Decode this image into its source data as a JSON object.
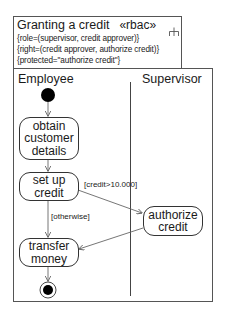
{
  "diagram": {
    "title": "Granting a credit",
    "stereotype": "«rbac»",
    "stereotype_icon": "activity-partition-icon",
    "constraints": [
      "{role=(supervisor, credit approver)}",
      "{right=(credit approver, authorize credit)}",
      "{protected=\"authorize credit\"}"
    ],
    "lanes": [
      {
        "label": "Employee"
      },
      {
        "label": "Supervisor"
      }
    ],
    "actions": [
      {
        "id": "obtain",
        "lines": [
          "obtain",
          "customer",
          "details"
        ],
        "lane": "Employee"
      },
      {
        "id": "setup",
        "lines": [
          "set up",
          "credit"
        ],
        "lane": "Employee"
      },
      {
        "id": "authorize",
        "lines": [
          "authorize",
          "credit"
        ],
        "lane": "Supervisor"
      },
      {
        "id": "transfer",
        "lines": [
          "transfer",
          "money"
        ],
        "lane": "Employee"
      }
    ],
    "guards": {
      "high_credit": "[credit>10.000]",
      "otherwise": "[otherwise]"
    },
    "initial_node": "initial-node",
    "final_node": "final-node"
  }
}
